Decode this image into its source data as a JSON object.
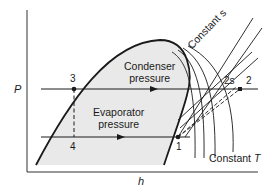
{
  "diagram": {
    "type": "pressure-enthalpy refrigeration cycle",
    "axes": {
      "x_label": "h",
      "y_label": "P"
    },
    "regions": {
      "condenser_line1": "Condenser",
      "condenser_line2": "pressure",
      "evaporator_line1": "Evaporator",
      "evaporator_line2": "pressure"
    },
    "curve_labels": {
      "constant_s": "Constant s",
      "constant_t_prefix": "Constant ",
      "constant_t_var": "T"
    },
    "points": {
      "p1": "1",
      "p2": "2",
      "p2s": "2s",
      "p3": "3",
      "p4": "4"
    },
    "colors": {
      "line": "#1a1a1a",
      "dome_fill": "#e9e9e9",
      "background": "#ffffff"
    }
  }
}
